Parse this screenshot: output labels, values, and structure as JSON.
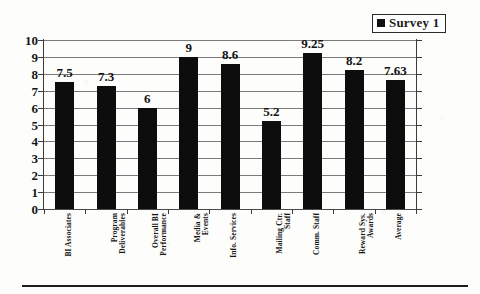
{
  "legend": {
    "marker_icon": "filled-square-marker",
    "label": "Survey 1",
    "marker_color": "#111111"
  },
  "axes": {
    "y_ticks": [
      "10",
      "9",
      "8",
      "7",
      "6",
      "5",
      "4",
      "3",
      "2",
      "1",
      "0"
    ],
    "y_min": 0,
    "y_max": 10,
    "y_step": 1
  },
  "bars": [
    {
      "category_line1": "BI Associates",
      "category_line2": "",
      "value": 7.5,
      "value_label": "7.5"
    },
    {
      "category_line1": "Program",
      "category_line2": "Deliverables",
      "value": 7.3,
      "value_label": "7.3"
    },
    {
      "category_line1": "Overall BI",
      "category_line2": "Performance",
      "value": 6,
      "value_label": "6"
    },
    {
      "category_line1": "Media &",
      "category_line2": "Events",
      "value": 9,
      "value_label": "9"
    },
    {
      "category_line1": "Info. Services",
      "category_line2": "",
      "value": 8.6,
      "value_label": "8.6"
    },
    {
      "category_line1": "Mailing Ctr.",
      "category_line2": "Staff",
      "value": 5.2,
      "value_label": "5.2"
    },
    {
      "category_line1": "Comm. Staff",
      "category_line2": "",
      "value": 9.25,
      "value_label": "9.25"
    },
    {
      "category_line1": "Reward Sys.",
      "category_line2": "Awards",
      "value": 8.2,
      "value_label": "8.2"
    },
    {
      "category_line1": "Average",
      "category_line2": "",
      "value": 7.63,
      "value_label": "7.63"
    }
  ],
  "chart_data": {
    "type": "bar",
    "title": "",
    "xlabel": "",
    "ylabel": "",
    "ylim": [
      0,
      10
    ],
    "ytick_step": 1,
    "grid": true,
    "legend_position": "top-right",
    "categories": [
      "BI Associates",
      "Program Deliverables",
      "Overall BI Performance",
      "Media & Events",
      "Info. Services",
      "Mailing Ctr. Staff",
      "Comm. Staff",
      "Reward Sys. Awards",
      "Average"
    ],
    "series": [
      {
        "name": "Survey 1",
        "color": "#0d0d0d",
        "values": [
          7.5,
          7.3,
          6,
          9,
          8.6,
          5.2,
          9.25,
          8.2,
          7.63
        ]
      }
    ],
    "data_labels": [
      "7.5",
      "7.3",
      "6",
      "9",
      "8.6",
      "5.2",
      "9.25",
      "8.2",
      "7.63"
    ]
  }
}
